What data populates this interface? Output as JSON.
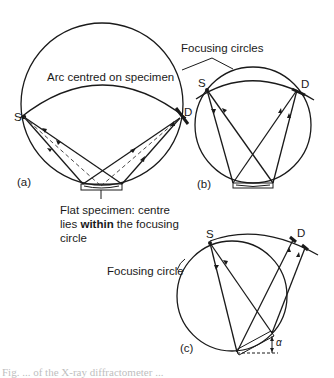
{
  "diagram": {
    "panel_a": {
      "label": "(a)",
      "source_label": "S",
      "detector_label": "D",
      "arc_label": "Arc centred on specimen",
      "specimen_note_line1": "Flat specimen: centre",
      "specimen_note_line2_pre": "lies ",
      "specimen_note_line2_bold": "within",
      "specimen_note_line2_post": " the focusing",
      "specimen_note_line3": "circle"
    },
    "panel_b": {
      "label": "(b)",
      "source_label": "S",
      "detector_label": "D",
      "focusing_label": "Focusing circles"
    },
    "panel_c": {
      "label": "(c)",
      "source_label": "S",
      "detector_label": "D",
      "focusing_label": "Focusing circle",
      "angle_label": "α"
    },
    "caption_fragment": "Fig. ... of the X-ray diffractometer ..."
  }
}
